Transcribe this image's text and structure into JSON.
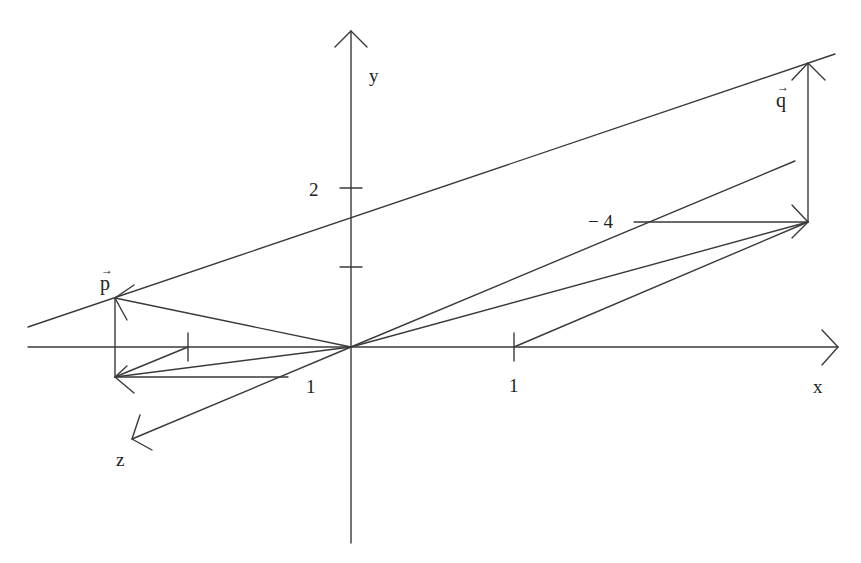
{
  "diagram": {
    "type": "3d-coordinate-system-with-vectors",
    "axes": {
      "x": {
        "label": "x",
        "tick_label": "1"
      },
      "y": {
        "label": "y",
        "tick_label": "2"
      },
      "z": {
        "label": "z",
        "tick_label": "1"
      }
    },
    "vectors": {
      "p": {
        "label": "p",
        "arrow": "→"
      },
      "q": {
        "label": "q",
        "arrow": "→"
      }
    },
    "annotations": {
      "neg_four": "− 4"
    },
    "stroke_color": "#3a3a3a",
    "background": "#ffffff"
  }
}
